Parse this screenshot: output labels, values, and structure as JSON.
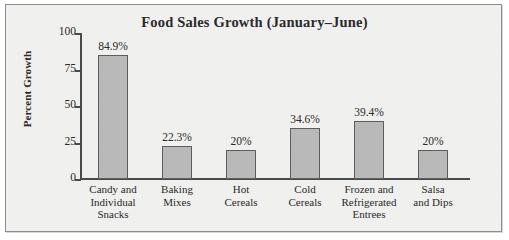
{
  "chart_data": {
    "type": "bar",
    "title": "Food Sales Growth (January–June)",
    "xlabel": "",
    "ylabel": "Percent Growth",
    "ylim": [
      0,
      100
    ],
    "yticks": [
      0,
      25,
      50,
      75,
      100
    ],
    "ytick_labels": [
      "0",
      "25",
      "50",
      "75",
      "100"
    ],
    "grid": false,
    "legend": "none",
    "categories": [
      "Candy and Individual Snacks",
      "Baking Mixes",
      "Hot Cereals",
      "Cold Cereals",
      "Frozen and Refrigerated Entrees",
      "Salsa and Dips"
    ],
    "category_lines": [
      [
        "Candy and",
        "Individual",
        "Snacks"
      ],
      [
        "Baking",
        "Mixes"
      ],
      [
        "Hot",
        "Cereals"
      ],
      [
        "Cold",
        "Cereals"
      ],
      [
        "Frozen and",
        "Refrigerated",
        "Entrees"
      ],
      [
        "Salsa",
        "and Dips"
      ]
    ],
    "values": [
      84.9,
      22.3,
      20,
      34.6,
      39.4,
      20
    ],
    "data_labels": [
      "84.9%",
      "22.3%",
      "20%",
      "34.6%",
      "39.4%",
      "20%"
    ],
    "colors": {
      "bar_fill": "#b9b9b9",
      "bar_border": "#5d5d5d",
      "axis": "#4a4a4a",
      "text": "#2a2a2a",
      "plot_background": "#f2f2f0",
      "frame_border": "#8d8d8d"
    }
  }
}
